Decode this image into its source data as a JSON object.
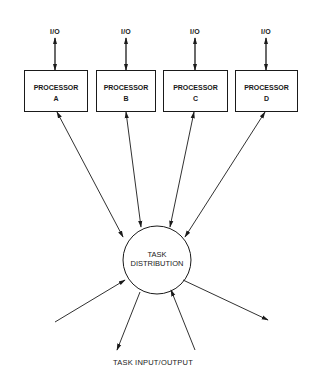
{
  "diagram": {
    "colors": {
      "stroke": "#1a1a1a",
      "background": "#ffffff"
    },
    "processors": [
      {
        "title": "PROCESSOR",
        "id": "A",
        "io_label": "I/O"
      },
      {
        "title": "PROCESSOR",
        "id": "B",
        "io_label": "I/O"
      },
      {
        "title": "PROCESSOR",
        "id": "C",
        "io_label": "I/O"
      },
      {
        "title": "PROCESSOR",
        "id": "D",
        "io_label": "I/O"
      }
    ],
    "hub": {
      "line1": "TASK",
      "line2": "DISTRIBUTION"
    },
    "bottom_label": "TASK INPUT/OUTPUT",
    "connections": [
      {
        "from": "I/O",
        "to": "PROCESSOR A",
        "direction": "bidirectional"
      },
      {
        "from": "I/O",
        "to": "PROCESSOR B",
        "direction": "bidirectional"
      },
      {
        "from": "I/O",
        "to": "PROCESSOR C",
        "direction": "bidirectional"
      },
      {
        "from": "I/O",
        "to": "PROCESSOR D",
        "direction": "bidirectional"
      },
      {
        "from": "PROCESSOR A",
        "to": "TASK DISTRIBUTION",
        "direction": "bidirectional"
      },
      {
        "from": "PROCESSOR B",
        "to": "TASK DISTRIBUTION",
        "direction": "bidirectional"
      },
      {
        "from": "PROCESSOR C",
        "to": "TASK DISTRIBUTION",
        "direction": "bidirectional"
      },
      {
        "from": "PROCESSOR D",
        "to": "TASK DISTRIBUTION",
        "direction": "bidirectional"
      },
      {
        "from": "TASK INPUT/OUTPUT",
        "to": "TASK DISTRIBUTION",
        "direction": "in"
      },
      {
        "from": "TASK DISTRIBUTION",
        "to": "TASK INPUT/OUTPUT",
        "direction": "out"
      },
      {
        "from": "TASK INPUT/OUTPUT",
        "to": "TASK DISTRIBUTION",
        "direction": "in"
      },
      {
        "from": "TASK DISTRIBUTION",
        "to": "TASK INPUT/OUTPUT",
        "direction": "out"
      }
    ]
  }
}
